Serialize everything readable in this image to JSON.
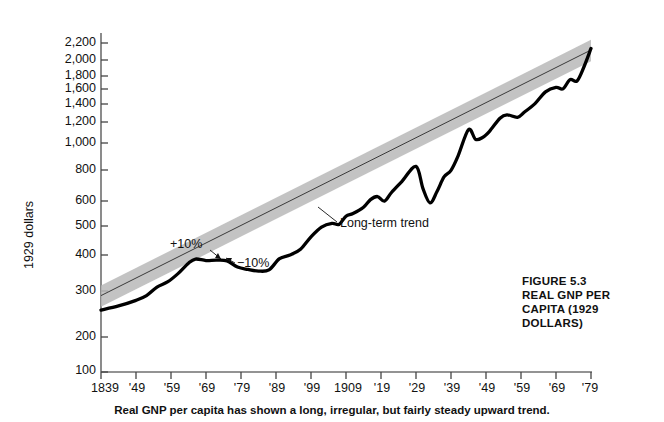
{
  "figure": {
    "title_lines": [
      "FIGURE 5.3",
      "REAL GNP PER",
      "CAPITA (1929",
      "DOLLARS)"
    ],
    "caption": "Real GNP per capita has shown a long, irregular, but fairly steady upward trend."
  },
  "annotations": {
    "plus_band": "+10%",
    "minus_band": "−10%",
    "trend": "Long-term trend"
  },
  "chart_data": {
    "type": "line",
    "title": "REAL GNP PER CAPITA (1929 DOLLARS)",
    "subtitle": "FIGURE 5.3",
    "xlabel": "",
    "ylabel": "1929 dollars",
    "yscale": "log",
    "ylim": [
      100,
      2400
    ],
    "xlim": [
      1839,
      1979
    ],
    "grid": false,
    "legend": "none",
    "ytick_labels": [
      "2,200",
      "2,000",
      "1,800",
      "1,600",
      "1,400",
      "1,200",
      "1,000",
      "800",
      "600",
      "500",
      "400",
      "300",
      "200",
      "100"
    ],
    "ytick_values": [
      2200,
      2000,
      1800,
      1600,
      1400,
      1200,
      1000,
      800,
      600,
      500,
      400,
      300,
      200,
      100
    ],
    "xtick_labels": [
      "1839",
      "'49",
      "'59",
      "'69",
      "'79",
      "'89",
      "'99",
      "1909",
      "'19",
      "'29",
      "'39",
      "'49",
      "'59",
      "'69",
      "'79"
    ],
    "xtick_values": [
      1839,
      1849,
      1859,
      1869,
      1879,
      1889,
      1899,
      1909,
      1919,
      1929,
      1939,
      1949,
      1959,
      1969,
      1979
    ],
    "series": [
      {
        "name": "Real GNP per capita",
        "x": [
          1839,
          1844,
          1849,
          1852,
          1855,
          1858,
          1861,
          1864,
          1866,
          1869,
          1872,
          1875,
          1878,
          1881,
          1884,
          1887,
          1890,
          1893,
          1896,
          1899,
          1902,
          1905,
          1907,
          1909,
          1911,
          1914,
          1916,
          1918,
          1920,
          1922,
          1925,
          1929,
          1931,
          1933,
          1935,
          1937,
          1939,
          1941,
          1944,
          1946,
          1948,
          1950,
          1953,
          1955,
          1958,
          1960,
          1963,
          1966,
          1969,
          1971,
          1973,
          1975,
          1977,
          1979
        ],
        "y": [
          179,
          186,
          196,
          205,
          222,
          233,
          252,
          278,
          289,
          285,
          286,
          284,
          268,
          262,
          258,
          261,
          290,
          300,
          317,
          356,
          390,
          404,
          400,
          432,
          443,
          470,
          505,
          520,
          498,
          540,
          600,
          690,
          560,
          490,
          545,
          625,
          665,
          760,
          975,
          890,
          905,
          960,
          1085,
          1120,
          1095,
          1150,
          1245,
          1390,
          1450,
          1430,
          1560,
          1540,
          1760,
          2090
        ]
      },
      {
        "name": "Long-term trend",
        "x": [
          1839,
          1979
        ],
        "y": [
          205,
          2060
        ]
      }
    ],
    "band": {
      "name": "±10% band around trend",
      "upper_pct": 10,
      "lower_pct": -10
    }
  }
}
